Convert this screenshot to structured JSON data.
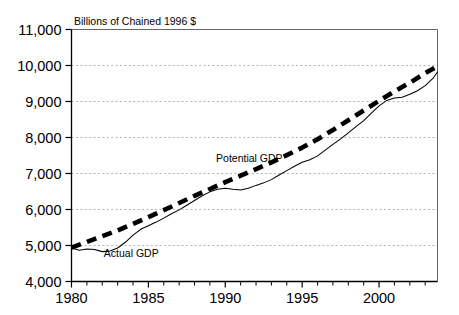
{
  "chart_data": {
    "type": "line",
    "title": "",
    "subtitle": "Billions of Chained 1996 $",
    "xlabel": "",
    "ylabel": "",
    "xlim": [
      1980,
      2003.8
    ],
    "ylim": [
      4000,
      11000
    ],
    "grid": true,
    "legend_position": "inline-annotation",
    "x_ticks": [
      1980,
      1985,
      1990,
      1995,
      2000
    ],
    "x_tick_labels": [
      "1980",
      "1985",
      "1990",
      "1995",
      "2000"
    ],
    "x_minor_tick_step": 1,
    "y_ticks": [
      4000,
      5000,
      6000,
      7000,
      8000,
      9000,
      10000,
      11000
    ],
    "y_tick_labels": [
      "4,000",
      "5,000",
      "6,000",
      "7,000",
      "8,000",
      "9,000",
      "10,000",
      "11,000"
    ],
    "annotations": [
      {
        "name": "potential-gdp-label",
        "text": "Potential GDP",
        "x": 1989.4,
        "y": 7330
      },
      {
        "name": "actual-gdp-label",
        "text": "Actual GDP",
        "x": 1982.1,
        "y": 4690
      }
    ],
    "series": [
      {
        "name": "Potential GDP",
        "style": "dashed",
        "color": "#000000",
        "x": [
          1980,
          1981,
          1982,
          1983,
          1984,
          1985,
          1986,
          1987,
          1988,
          1989,
          1990,
          1991,
          1992,
          1993,
          1994,
          1995,
          1996,
          1997,
          1998,
          1999,
          2000,
          2001,
          2002,
          2003,
          2003.8
        ],
        "values": [
          4940,
          5100,
          5260,
          5420,
          5600,
          5790,
          5980,
          6180,
          6380,
          6570,
          6760,
          6940,
          7120,
          7310,
          7510,
          7720,
          7950,
          8210,
          8480,
          8750,
          9020,
          9280,
          9520,
          9790,
          9980
        ]
      },
      {
        "name": "Actual GDP",
        "style": "solid",
        "color": "#000000",
        "x": [
          1980,
          1980.5,
          1981,
          1981.5,
          1982,
          1982.5,
          1983,
          1983.5,
          1984,
          1984.5,
          1985,
          1985.5,
          1986,
          1986.5,
          1987,
          1987.5,
          1988,
          1988.5,
          1989,
          1989.5,
          1990,
          1990.5,
          1991,
          1991.5,
          1992,
          1992.5,
          1993,
          1993.5,
          1994,
          1994.5,
          1995,
          1995.5,
          1996,
          1996.5,
          1997,
          1997.5,
          1998,
          1998.5,
          1999,
          1999.5,
          2000,
          2000.5,
          2001,
          2001.5,
          2002,
          2002.5,
          2003,
          2003.5,
          2003.8
        ],
        "values": [
          4930,
          4870,
          4900,
          4890,
          4830,
          4850,
          4930,
          5090,
          5290,
          5450,
          5550,
          5650,
          5760,
          5880,
          5990,
          6120,
          6250,
          6380,
          6490,
          6560,
          6590,
          6560,
          6540,
          6590,
          6670,
          6740,
          6830,
          6960,
          7080,
          7200,
          7310,
          7380,
          7490,
          7650,
          7810,
          7960,
          8130,
          8300,
          8470,
          8680,
          8880,
          9030,
          9100,
          9120,
          9200,
          9300,
          9440,
          9640,
          9820
        ]
      }
    ]
  },
  "axes": {
    "y_axis_name": "y-axis",
    "x_axis_name": "x-axis"
  }
}
